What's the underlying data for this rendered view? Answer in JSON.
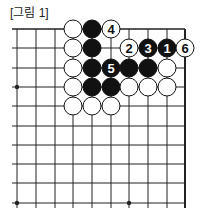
{
  "caption": "[그림 1]",
  "board": {
    "columns_x": [
      17,
      36,
      55,
      73,
      92,
      111,
      129,
      148,
      167,
      185
    ],
    "rows_y": [
      29,
      48,
      68,
      87,
      106,
      126,
      145,
      164,
      183,
      203
    ],
    "star_points": [
      [
        0,
        3
      ],
      [
        0,
        9
      ],
      [
        6,
        9
      ]
    ],
    "stone_radius": 9,
    "colors": {
      "black": "#111111",
      "white": "#ffffff",
      "line": "#222222"
    }
  },
  "stones": [
    {
      "col": 3,
      "row": 0,
      "color": "white",
      "label": ""
    },
    {
      "col": 4,
      "row": 0,
      "color": "black",
      "label": ""
    },
    {
      "col": 5,
      "row": 0,
      "color": "white",
      "label": "4"
    },
    {
      "col": 3,
      "row": 1,
      "color": "white",
      "label": ""
    },
    {
      "col": 4,
      "row": 1,
      "color": "black",
      "label": ""
    },
    {
      "col": 6,
      "row": 1,
      "color": "white",
      "label": "2"
    },
    {
      "col": 7,
      "row": 1,
      "color": "black",
      "label": "3"
    },
    {
      "col": 8,
      "row": 1,
      "color": "black",
      "label": "1"
    },
    {
      "col": 9,
      "row": 1,
      "color": "white",
      "label": "6"
    },
    {
      "col": 3,
      "row": 2,
      "color": "white",
      "label": ""
    },
    {
      "col": 4,
      "row": 2,
      "color": "black",
      "label": ""
    },
    {
      "col": 5,
      "row": 2,
      "color": "black",
      "label": "5"
    },
    {
      "col": 6,
      "row": 2,
      "color": "black",
      "label": ""
    },
    {
      "col": 7,
      "row": 2,
      "color": "black",
      "label": ""
    },
    {
      "col": 8,
      "row": 2,
      "color": "white",
      "label": ""
    },
    {
      "col": 3,
      "row": 3,
      "color": "white",
      "label": ""
    },
    {
      "col": 4,
      "row": 3,
      "color": "black",
      "label": ""
    },
    {
      "col": 5,
      "row": 3,
      "color": "black",
      "label": ""
    },
    {
      "col": 6,
      "row": 3,
      "color": "white",
      "label": ""
    },
    {
      "col": 7,
      "row": 3,
      "color": "white",
      "label": ""
    },
    {
      "col": 8,
      "row": 3,
      "color": "white",
      "label": ""
    },
    {
      "col": 3,
      "row": 4,
      "color": "white",
      "label": ""
    },
    {
      "col": 4,
      "row": 4,
      "color": "white",
      "label": ""
    },
    {
      "col": 5,
      "row": 4,
      "color": "white",
      "label": ""
    }
  ]
}
